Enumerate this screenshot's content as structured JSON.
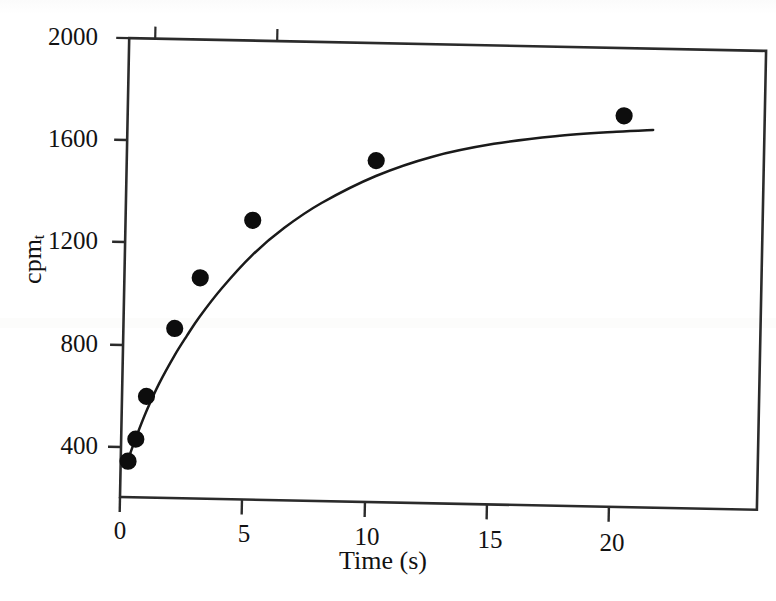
{
  "chart_data": {
    "type": "scatter",
    "title": "",
    "subtitle": "",
    "xlabel": "Time (s)",
    "ylabel": "cpm_t",
    "ylabel_base": "cpm",
    "ylabel_sub": "t",
    "xlim": [
      0,
      23.5
    ],
    "ylim": [
      260,
      2000
    ],
    "xticks": [
      0,
      5,
      10,
      15,
      20
    ],
    "xticklabels": [
      "0",
      "5",
      "10",
      "15",
      "20"
    ],
    "yticks": [
      400,
      800,
      1200,
      1600,
      2000
    ],
    "yticklabels": [
      "400",
      "800",
      "1200",
      "1600",
      "2000"
    ],
    "grid": false,
    "legend": null,
    "marker": "filled-circle",
    "marker_color": "#0d0d0d",
    "line_color": "#1a1a1a",
    "axis_color": "#2b2b2b",
    "background": "#ffffff",
    "series": [
      {
        "name": "cpm_t vs time",
        "kind": "points",
        "x": [
          0.3,
          0.6,
          1.0,
          2.1,
          3.1,
          5.2,
          10.2,
          20.3
        ],
        "y": [
          345,
          432,
          600,
          868,
          1068,
          1297,
          1540,
          1735
        ]
      },
      {
        "name": "fitted exponential curve",
        "kind": "line",
        "x": [
          0.3,
          0.6,
          1.0,
          1.5,
          2.1,
          2.6,
          3.1,
          4.0,
          5.2,
          6.5,
          8.0,
          10.2,
          12.5,
          15.0,
          17.5,
          20.0,
          21.5
        ],
        "y": [
          352,
          437,
          540,
          650,
          760,
          840,
          915,
          1030,
          1160,
          1270,
          1370,
          1480,
          1560,
          1615,
          1650,
          1672,
          1682
        ]
      }
    ],
    "annotations": []
  },
  "axes": {
    "frame": "full-box",
    "tick_direction": "out"
  }
}
